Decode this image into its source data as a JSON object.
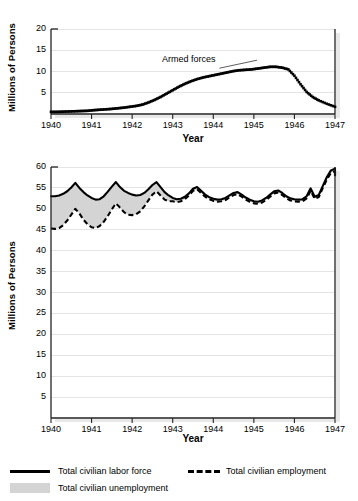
{
  "figure": {
    "background": "#ffffff",
    "grid_color": "#e4e4e4",
    "axis_color": "#222222",
    "fill_color": "#d4d4d4",
    "line_color": "#000000"
  },
  "panels": [
    {
      "id": "armed-forces",
      "ylabel": "Millions of Persons",
      "xlabel": "Year",
      "annotation": "Armed forces",
      "yticks": [
        "5",
        "10",
        "15",
        "20"
      ],
      "xticks": [
        "1940",
        "1941",
        "1942",
        "1943",
        "1944",
        "1945",
        "1946",
        "1947"
      ]
    },
    {
      "id": "labor-force",
      "ylabel": "Millions of Persons",
      "xlabel": "Year",
      "yticks": [
        "5",
        "10",
        "15",
        "20",
        "25",
        "30",
        "35",
        "40",
        "45",
        "50",
        "55",
        "60"
      ],
      "xticks": [
        "1940",
        "1941",
        "1942",
        "1943",
        "1944",
        "1945",
        "1946",
        "1947"
      ]
    }
  ],
  "legend": {
    "items": [
      {
        "label": "Total civilian labor force",
        "marker": "solid-line",
        "color": "#000000"
      },
      {
        "label": "Total civilian employment",
        "marker": "dashed-line",
        "color": "#000000"
      },
      {
        "label": "Total civilian unemployment",
        "marker": "filled-swatch",
        "color": "#d4d4d4"
      }
    ]
  },
  "chart_data": [
    {
      "type": "line",
      "id": "armed-forces",
      "title": "",
      "xlabel": "Year",
      "ylabel": "Millions of Persons",
      "xlim": [
        1940,
        1947
      ],
      "ylim": [
        0,
        20
      ],
      "ytick_values": [
        5,
        10,
        15,
        20
      ],
      "xtick_values": [
        1940,
        1941,
        1942,
        1943,
        1944,
        1945,
        1946,
        1947
      ],
      "grid": "horizontal",
      "legend_position": "none",
      "annotations": [
        {
          "text": "Armed forces",
          "x": 1943.45,
          "y": 13.6,
          "leader_to_x": 1944.15,
          "leader_to_y": 10.3
        }
      ],
      "series": [
        {
          "name": "Armed forces",
          "style": "dotted",
          "x": [
            1940.0,
            1940.15,
            1940.3,
            1940.45,
            1940.6,
            1940.75,
            1940.9,
            1941.05,
            1941.2,
            1941.35,
            1941.5,
            1941.65,
            1941.8,
            1941.95,
            1942.1,
            1942.25,
            1942.4,
            1942.55,
            1942.7,
            1942.85,
            1943.0,
            1943.15,
            1943.3,
            1943.45,
            1943.6,
            1943.75,
            1943.9,
            1944.05,
            1944.2,
            1944.35,
            1944.5,
            1944.65,
            1944.8,
            1944.95,
            1945.1,
            1945.25,
            1945.4,
            1945.55,
            1945.7,
            1945.85,
            1946.0,
            1946.15,
            1946.3,
            1946.45,
            1946.6,
            1946.8,
            1947.0
          ],
          "y": [
            0.5,
            0.5,
            0.55,
            0.6,
            0.65,
            0.7,
            0.75,
            0.9,
            1.0,
            1.1,
            1.2,
            1.35,
            1.5,
            1.7,
            1.9,
            2.2,
            2.7,
            3.3,
            4.0,
            4.8,
            5.6,
            6.4,
            7.1,
            7.7,
            8.2,
            8.6,
            8.9,
            9.2,
            9.5,
            9.8,
            10.1,
            10.3,
            10.4,
            10.5,
            10.7,
            10.9,
            11.1,
            11.1,
            10.9,
            10.5,
            9.0,
            7.0,
            5.2,
            4.0,
            3.2,
            2.4,
            1.7
          ]
        }
      ]
    },
    {
      "type": "line",
      "id": "labor-force",
      "title": "",
      "xlabel": "Year",
      "ylabel": "Millions of Persons",
      "xlim": [
        1940,
        1947
      ],
      "ylim": [
        0,
        60
      ],
      "ytick_values": [
        5,
        10,
        15,
        20,
        25,
        30,
        35,
        40,
        45,
        50,
        55,
        60
      ],
      "xtick_values": [
        1940,
        1941,
        1942,
        1943,
        1944,
        1945,
        1946,
        1947
      ],
      "grid": "horizontal",
      "legend_position": "below",
      "fill_between": {
        "upper": "Total civilian labor force",
        "lower": "Total civilian employment",
        "label": "Total civilian unemployment",
        "color": "#d4d4d4"
      },
      "x": [
        1940.0,
        1940.1,
        1940.2,
        1940.3,
        1940.4,
        1940.5,
        1940.6,
        1940.7,
        1940.8,
        1940.9,
        1941.0,
        1941.1,
        1941.2,
        1941.3,
        1941.4,
        1941.5,
        1941.6,
        1941.7,
        1941.8,
        1941.9,
        1942.0,
        1942.1,
        1942.2,
        1942.3,
        1942.4,
        1942.5,
        1942.6,
        1942.7,
        1942.8,
        1942.9,
        1943.0,
        1943.1,
        1943.2,
        1943.3,
        1943.4,
        1943.5,
        1943.6,
        1943.7,
        1943.8,
        1943.9,
        1944.0,
        1944.1,
        1944.2,
        1944.3,
        1944.4,
        1944.5,
        1944.6,
        1944.7,
        1944.8,
        1944.9,
        1945.0,
        1945.1,
        1945.2,
        1945.3,
        1945.4,
        1945.5,
        1945.6,
        1945.7,
        1945.8,
        1945.9,
        1946.0,
        1946.1,
        1946.2,
        1946.3,
        1946.4,
        1946.5,
        1946.6,
        1946.7,
        1946.8,
        1946.9,
        1947.0
      ],
      "series": [
        {
          "name": "Total civilian labor force",
          "style": "solid",
          "values": [
            53.0,
            53.0,
            53.2,
            53.6,
            54.2,
            55.1,
            56.2,
            55.0,
            54.0,
            53.2,
            52.6,
            52.2,
            52.3,
            53.0,
            54.1,
            55.3,
            56.4,
            55.2,
            54.3,
            53.8,
            53.4,
            53.2,
            53.3,
            53.8,
            54.7,
            55.7,
            56.4,
            55.2,
            54.0,
            53.2,
            52.6,
            52.3,
            52.4,
            52.9,
            53.7,
            54.8,
            55.2,
            54.3,
            53.4,
            52.8,
            52.4,
            52.2,
            52.3,
            52.6,
            53.2,
            53.8,
            54.0,
            53.4,
            52.7,
            52.2,
            51.8,
            51.7,
            52.0,
            52.6,
            53.4,
            54.2,
            54.4,
            53.8,
            53.0,
            52.5,
            52.3,
            52.2,
            52.3,
            53.0,
            54.9,
            52.9,
            53.3,
            55.5,
            57.6,
            59.2,
            59.6
          ],
          "endpoints": [
            59.6,
            58.1
          ]
        },
        {
          "name": "Total civilian employment",
          "style": "dashed",
          "values": [
            45.3,
            45.2,
            45.4,
            46.1,
            47.2,
            48.6,
            50.0,
            48.9,
            47.4,
            46.3,
            45.6,
            45.4,
            45.9,
            46.9,
            48.3,
            49.9,
            51.3,
            50.3,
            49.2,
            48.6,
            48.5,
            48.7,
            49.4,
            50.6,
            52.0,
            53.4,
            54.2,
            53.2,
            52.2,
            51.8,
            51.8,
            51.6,
            51.8,
            52.3,
            53.2,
            54.3,
            54.7,
            53.8,
            52.9,
            52.3,
            51.9,
            51.7,
            51.8,
            52.1,
            52.7,
            53.3,
            53.5,
            52.9,
            52.2,
            51.7,
            51.3,
            51.2,
            51.5,
            52.1,
            52.9,
            53.7,
            53.9,
            53.3,
            52.5,
            52.0,
            51.8,
            51.7,
            51.8,
            52.5,
            54.3,
            52.4,
            52.8,
            55.0,
            57.0,
            58.6,
            59.0
          ]
        }
      ]
    }
  ]
}
